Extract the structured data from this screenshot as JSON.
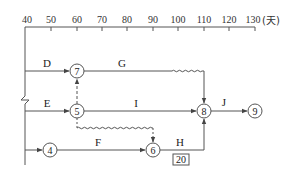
{
  "timescale": {
    "ticks": [
      "40",
      "50",
      "60",
      "70",
      "80",
      "90",
      "100",
      "110",
      "120",
      "130"
    ],
    "unit": "(天)"
  },
  "nodes": {
    "n4": "4",
    "n5": "5",
    "n6": "6",
    "n7": "7",
    "n8": "8",
    "n9": "9"
  },
  "activities": {
    "D": "D",
    "E": "E",
    "F": "F",
    "G": "G",
    "H": "H",
    "I": "I",
    "J": "J"
  },
  "annotation": {
    "h_box_value": "20"
  },
  "colors": {
    "line": "#555555",
    "text": "#222222"
  }
}
